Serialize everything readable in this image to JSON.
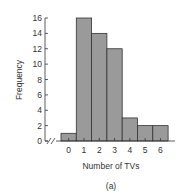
{
  "chart_data": {
    "type": "bar",
    "title": "",
    "caption": "(a)",
    "xlabel": "Number of TVs",
    "ylabel": "Frequency",
    "categories": [
      "0",
      "1",
      "2",
      "3",
      "4",
      "5",
      "6"
    ],
    "values": [
      1,
      16,
      14,
      12,
      3,
      2,
      2
    ],
    "ylim": [
      0,
      16
    ],
    "yticks": [
      "0",
      "2",
      "4",
      "6",
      "8",
      "10",
      "12",
      "14",
      "16"
    ],
    "grid": false,
    "legend": null,
    "axis_break": true,
    "bar_color": "#9a9a9a",
    "bar_edge_color": "#333333"
  }
}
